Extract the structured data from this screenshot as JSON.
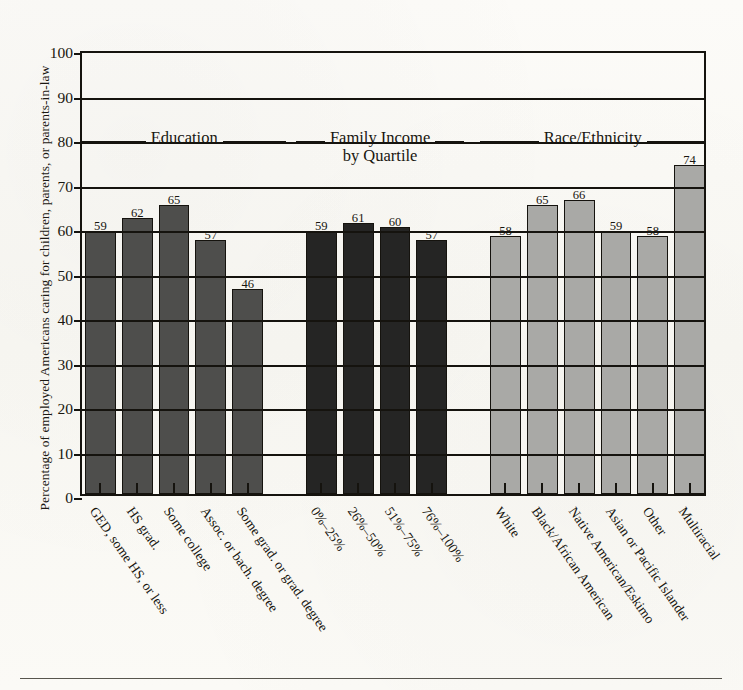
{
  "chart_data": {
    "type": "bar",
    "title": "",
    "xlabel": "",
    "ylabel": "Percentage of employed Americans caring for children, parents, or parents-in-law",
    "ylim": [
      0,
      100
    ],
    "ytick_step": 10,
    "yticks": [
      "0",
      "10",
      "20",
      "30",
      "40",
      "50",
      "60",
      "70",
      "80",
      "90",
      "100"
    ],
    "grid": true,
    "legend": "none",
    "groups": [
      {
        "name": "Education",
        "header_lines": [
          "Education"
        ],
        "color": "#4e4e4c",
        "categories": [
          "GED, some HS, or less",
          "HS grad.",
          "Some college",
          "Assoc. or bach. degree",
          "Some grad. or grad. degree"
        ],
        "values": [
          59,
          62,
          65,
          57,
          46
        ]
      },
      {
        "name": "Family Income by Quartile",
        "header_lines": [
          "Family Income",
          "by Quartile"
        ],
        "color": "#252524",
        "categories": [
          "0%–25%",
          "26%–50%",
          "51%–75%",
          "76%–100%"
        ],
        "values": [
          59,
          61,
          60,
          57
        ]
      },
      {
        "name": "Race/Ethnicity",
        "header_lines": [
          "Race/Ethnicity"
        ],
        "color": "#a9a9a6",
        "categories": [
          "White",
          "Black/African American",
          "Native American/Eskimo",
          "Asian or Pacific Islander",
          "Other",
          "Multiracial"
        ],
        "values": [
          58,
          65,
          66,
          59,
          58,
          74
        ]
      }
    ],
    "categories": [
      "GED, some HS, or less",
      "HS grad.",
      "Some college",
      "Assoc. or bach. degree",
      "Some grad. or grad. degree",
      "0%–25%",
      "26%–50%",
      "51%–75%",
      "76%–100%",
      "White",
      "Black/African American",
      "Native American/Eskimo",
      "Asian or Pacific Islander",
      "Other",
      "Multiracial"
    ],
    "values": [
      59,
      62,
      65,
      57,
      46,
      59,
      61,
      60,
      57,
      58,
      65,
      66,
      59,
      58,
      74
    ],
    "colors": {
      "education": "#4e4e4c",
      "income": "#252524",
      "race": "#a9a9a6",
      "axis": "#15130e",
      "paper": "#fbfaf7"
    }
  }
}
